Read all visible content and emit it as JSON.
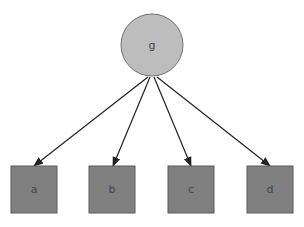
{
  "diagram": {
    "colors": {
      "root_fill": "#bdbdbd",
      "root_stroke": "#707070",
      "leaf_fill": "#808080",
      "leaf_stroke": "#5a5a5a",
      "edge": "#222222"
    },
    "root": {
      "id": "g",
      "label": "g",
      "shape": "circle",
      "cx": 152,
      "cy": 45,
      "r": 31
    },
    "leaves": [
      {
        "id": "a",
        "label": "a",
        "shape": "square",
        "x": 11,
        "y": 166,
        "w": 46,
        "h": 47
      },
      {
        "id": "b",
        "label": "b",
        "shape": "square",
        "x": 89,
        "y": 166,
        "w": 46,
        "h": 47
      },
      {
        "id": "c",
        "label": "c",
        "shape": "square",
        "x": 168,
        "y": 166,
        "w": 46,
        "h": 47
      },
      {
        "id": "d",
        "label": "d",
        "shape": "square",
        "x": 247,
        "y": 166,
        "w": 46,
        "h": 47
      }
    ],
    "edges": [
      {
        "from": "g",
        "to": "a"
      },
      {
        "from": "g",
        "to": "b"
      },
      {
        "from": "g",
        "to": "c"
      },
      {
        "from": "g",
        "to": "d"
      }
    ]
  }
}
